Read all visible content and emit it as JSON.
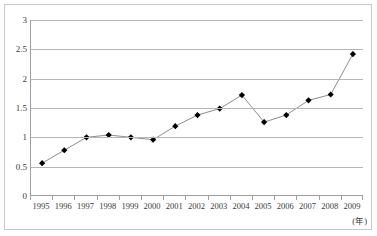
{
  "chart_data": {
    "type": "line",
    "title": "",
    "subtitle": "",
    "xlabel": "(年)",
    "ylabel": "",
    "categories": [
      "1995",
      "1996",
      "1997",
      "1998",
      "1999",
      "2000",
      "2001",
      "2002",
      "2003",
      "2004",
      "2005",
      "2006",
      "2007",
      "2008",
      "2009"
    ],
    "values": [
      0.56,
      0.78,
      1.0,
      1.04,
      1.0,
      0.96,
      1.19,
      1.38,
      1.49,
      1.72,
      1.26,
      1.38,
      1.63,
      1.73,
      2.42
    ],
    "series": [
      {
        "name": "",
        "values": [
          0.56,
          0.78,
          1.0,
          1.04,
          1.0,
          0.96,
          1.19,
          1.38,
          1.49,
          1.72,
          1.26,
          1.38,
          1.63,
          1.73,
          2.42
        ]
      }
    ],
    "ylim": [
      0,
      3
    ],
    "yticks": [
      0,
      0.5,
      1,
      1.5,
      2,
      2.5,
      3
    ],
    "ytick_labels": [
      "0",
      "0.5",
      "1",
      "1.5",
      "2",
      "2.5",
      "3"
    ],
    "grid": true,
    "grid_axis": "y",
    "legend": false,
    "legend_position": "none",
    "marker": "diamond",
    "annotations": []
  },
  "colors": {
    "line": "#8c8c8c",
    "marker": "#000000",
    "gridline": "#b6b6b6",
    "axis": "#a0a0a0",
    "frame": "#c9c9c9",
    "text": "#3a3a3a",
    "background": "#ffffff"
  }
}
